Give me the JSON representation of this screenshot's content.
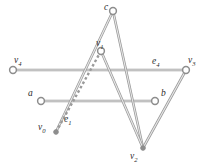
{
  "figure": {
    "background_color": "#ffffff",
    "edge_color": "#9a9a9a",
    "label_color": "#2b2b2b",
    "width": 209,
    "height": 163
  },
  "vertices": [
    {
      "id": "c",
      "label": "c",
      "sub": "",
      "x": 113,
      "y": 11,
      "marker": "circle",
      "label_x": 104,
      "label_y": 10
    },
    {
      "id": "v1",
      "label": "v",
      "sub": "1",
      "x": 101,
      "y": 51,
      "marker": "circle",
      "label_x": 96,
      "label_y": 46
    },
    {
      "id": "v4",
      "label": "v",
      "sub": "4",
      "x": 13,
      "y": 70,
      "marker": "circle",
      "label_x": 14,
      "label_y": 63
    },
    {
      "id": "v3",
      "label": "v",
      "sub": "3",
      "x": 186,
      "y": 70,
      "marker": "circle",
      "label_x": 188,
      "label_y": 63
    },
    {
      "id": "a",
      "label": "a",
      "sub": "",
      "x": 41,
      "y": 101,
      "marker": "circle",
      "label_x": 28,
      "label_y": 96
    },
    {
      "id": "b",
      "label": "b",
      "sub": "",
      "x": 155,
      "y": 101,
      "marker": "circle",
      "label_x": 161,
      "label_y": 96
    },
    {
      "id": "v0",
      "label": "v",
      "sub": "0",
      "x": 56,
      "y": 132,
      "marker": "dot",
      "label_x": 38,
      "label_y": 130
    },
    {
      "id": "v2",
      "label": "v",
      "sub": "2",
      "x": 143,
      "y": 148,
      "marker": "dot",
      "label_x": 130,
      "label_y": 159
    }
  ],
  "edges": [
    {
      "id": "e4",
      "from": "v4",
      "to": "v3",
      "style": "solid",
      "label": "e",
      "sub": "4",
      "label_x": 152,
      "label_y": 64
    },
    {
      "id": "ab",
      "from": "a",
      "to": "b",
      "style": "solid",
      "label": "",
      "sub": "",
      "label_x": 0,
      "label_y": 0
    },
    {
      "id": "c-v0",
      "from": "c",
      "to": "v0",
      "style": "solid",
      "label": "",
      "sub": "",
      "label_x": 0,
      "label_y": 0
    },
    {
      "id": "c-v2",
      "from": "c",
      "to": "v2",
      "style": "solid",
      "label": "",
      "sub": "",
      "label_x": 0,
      "label_y": 0
    },
    {
      "id": "e1",
      "from": "v1",
      "to": "v0",
      "style": "dashed",
      "label": "e",
      "sub": "1",
      "label_x": 64,
      "label_y": 122
    },
    {
      "id": "v1-v2",
      "from": "v1",
      "to": "v2",
      "style": "solid",
      "label": "",
      "sub": "",
      "label_x": 0,
      "label_y": 0
    },
    {
      "id": "v3-v2",
      "from": "v3",
      "to": "v2",
      "style": "solid",
      "label": "",
      "sub": "",
      "label_x": 0,
      "label_y": 0
    }
  ]
}
